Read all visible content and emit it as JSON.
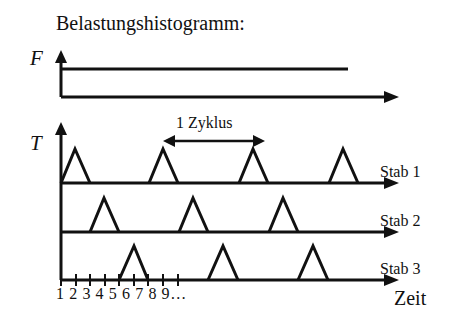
{
  "title": "Belastungshistogramm:",
  "force_axis": {
    "label": "F"
  },
  "torque_axis": {
    "label": "T"
  },
  "cycle_label": "1 Zyklus",
  "rows": [
    {
      "label": "Stab 1",
      "pulses_start_ticks": [
        1,
        7,
        13,
        19
      ]
    },
    {
      "label": "Stab 2",
      "pulses_start_ticks": [
        3,
        9,
        15
      ]
    },
    {
      "label": "Stab 3",
      "pulses_start_ticks": [
        5,
        11,
        17
      ]
    }
  ],
  "x_ticks_label": "1 2 3 4 5 6 7 8 9…",
  "x_axis_label": "Zeit",
  "colors": {
    "line": "#111111",
    "background": "#ffffff"
  }
}
